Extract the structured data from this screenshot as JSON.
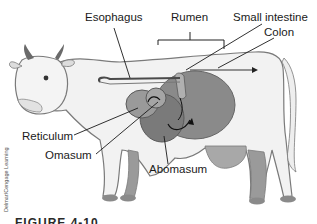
{
  "diagram": {
    "labels": {
      "esophagus": "Esophagus",
      "rumen": "Rumen",
      "small_intestine": "Small intestine",
      "colon": "Colon",
      "reticulum": "Reticulum",
      "omasum": "Omasum",
      "abomasum": "Abomasum"
    },
    "credit": "Delmar/Cengage Learning",
    "caption": "FIGURE 4-10"
  },
  "colors": {
    "outline": "#6e6e6e",
    "body_fill": "#f2f2f2",
    "organ_fill": "#8a8a8a",
    "organ_dark": "#6a6a6a",
    "leader_line": "#1a1a1a"
  }
}
